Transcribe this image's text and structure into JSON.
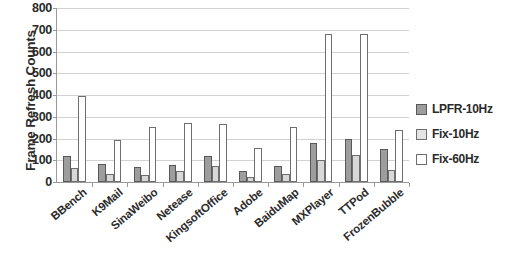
{
  "chart_data": {
    "type": "bar",
    "title": "",
    "xlabel": "",
    "ylabel": "Frame Refresh Counts",
    "ylim": [
      0,
      800
    ],
    "yticks": [
      0,
      100,
      200,
      300,
      400,
      500,
      600,
      700,
      800
    ],
    "grid": true,
    "legend_position": "right",
    "categories": [
      "BBench",
      "K9Mail",
      "SinaWeibo",
      "Netease",
      "KingsoftOffice",
      "Adobe",
      "BaiduMap",
      "MXPlayer",
      "TTPod",
      "FrozenBubble"
    ],
    "series": [
      {
        "name": "LPFR-10Hz",
        "color": "#9d9d9d",
        "values": [
          120,
          85,
          67,
          78,
          118,
          50,
          75,
          180,
          200,
          150
        ]
      },
      {
        "name": "Fix-10Hz",
        "color": "#d8d8d8",
        "values": [
          65,
          35,
          30,
          50,
          72,
          22,
          35,
          100,
          125,
          55
        ]
      },
      {
        "name": "Fix-60Hz",
        "color": "#ffffff",
        "values": [
          395,
          195,
          255,
          270,
          265,
          155,
          255,
          680,
          680,
          240
        ]
      }
    ]
  }
}
